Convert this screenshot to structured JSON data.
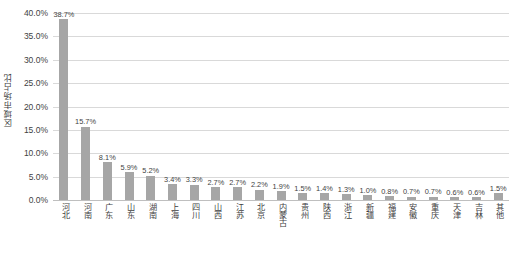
{
  "chart_data": {
    "type": "bar",
    "title": "",
    "xlabel": "",
    "ylabel": "区域市场占比",
    "ylim": [
      0,
      40
    ],
    "ytick_labels": [
      "40.0%",
      "35.0%",
      "30.0%",
      "25.0%",
      "20.0%",
      "15.0%",
      "10.0%",
      "5.0%",
      "0.0%"
    ],
    "ytick_values": [
      40,
      35,
      30,
      25,
      20,
      15,
      10,
      5,
      0
    ],
    "grid": true,
    "legend": "none",
    "categories": [
      "河北",
      "河南",
      "广东",
      "山东",
      "湖南",
      "上海",
      "四川",
      "山西",
      "江苏",
      "北京",
      "内蒙古",
      "贵州",
      "陕西",
      "浙江",
      "新疆",
      "福建",
      "安徽",
      "重庆",
      "天津",
      "吉林",
      "其他"
    ],
    "values": [
      38.7,
      15.7,
      8.1,
      5.9,
      5.2,
      3.4,
      3.3,
      2.7,
      2.7,
      2.2,
      1.9,
      1.5,
      1.4,
      1.3,
      1.0,
      0.8,
      0.7,
      0.7,
      0.6,
      0.6,
      1.5
    ],
    "value_labels": [
      "38.7%",
      "15.7%",
      "8.1%",
      "5.9%",
      "5.2%",
      "3.4%",
      "3.3%",
      "2.7%",
      "2.7%",
      "2.2%",
      "1.9%",
      "1.5%",
      "1.4%",
      "1.3%",
      "1.0%",
      "0.8%",
      "0.7%",
      "0.7%",
      "0.6%",
      "0.6%",
      "1.5%"
    ],
    "bar_color": "#a6a6a6",
    "grid_color": "#d9d9d9",
    "text_color": "#3f3f3f"
  }
}
